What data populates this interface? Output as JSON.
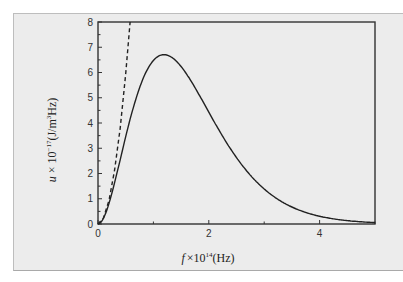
{
  "chart_data": {
    "type": "line",
    "title": "",
    "xlabel": "f ×10^14(Hz)",
    "ylabel": "u × 10^-17 (J/m^3Hz)",
    "xlim": [
      0,
      5
    ],
    "ylim": [
      0,
      8
    ],
    "x_ticks": [
      0,
      2,
      4
    ],
    "x_minor_ticks": [
      1,
      3,
      5
    ],
    "y_ticks": [
      0,
      1,
      2,
      3,
      4,
      5,
      6,
      7,
      8
    ],
    "grid": false,
    "legend": null,
    "series": [
      {
        "name": "Planck distribution",
        "style": "solid",
        "color": "#222222",
        "x": [
          0,
          0.2,
          0.4,
          0.6,
          0.8,
          1.0,
          1.2,
          1.4,
          1.6,
          1.8,
          2.0,
          2.5,
          3.0,
          3.5,
          4.0,
          4.5,
          5.0
        ],
        "y": [
          0,
          0.5,
          1.7,
          3.2,
          4.7,
          5.8,
          6.3,
          6.2,
          5.8,
          5.1,
          4.4,
          2.7,
          1.5,
          0.75,
          0.35,
          0.15,
          0.07
        ]
      },
      {
        "name": "Rayleigh-Jeans",
        "style": "dashed",
        "color": "#222222",
        "x": [
          0,
          0.1,
          0.2,
          0.3,
          0.4,
          0.5,
          0.58
        ],
        "y": [
          0,
          0.24,
          0.95,
          2.14,
          3.8,
          5.95,
          8.0
        ]
      }
    ],
    "annotations": []
  },
  "labels": {
    "x_axis_f": "f",
    "x_axis_rest": "×10",
    "x_axis_exp": "14",
    "x_axis_unit": "(Hz)",
    "y_axis_u": "u",
    "y_axis_rest": " × 10",
    "y_axis_exp": "−17",
    "y_axis_unit1": "(J/m",
    "y_axis_unit_exp": "3",
    "y_axis_unit2": "Hz)"
  }
}
